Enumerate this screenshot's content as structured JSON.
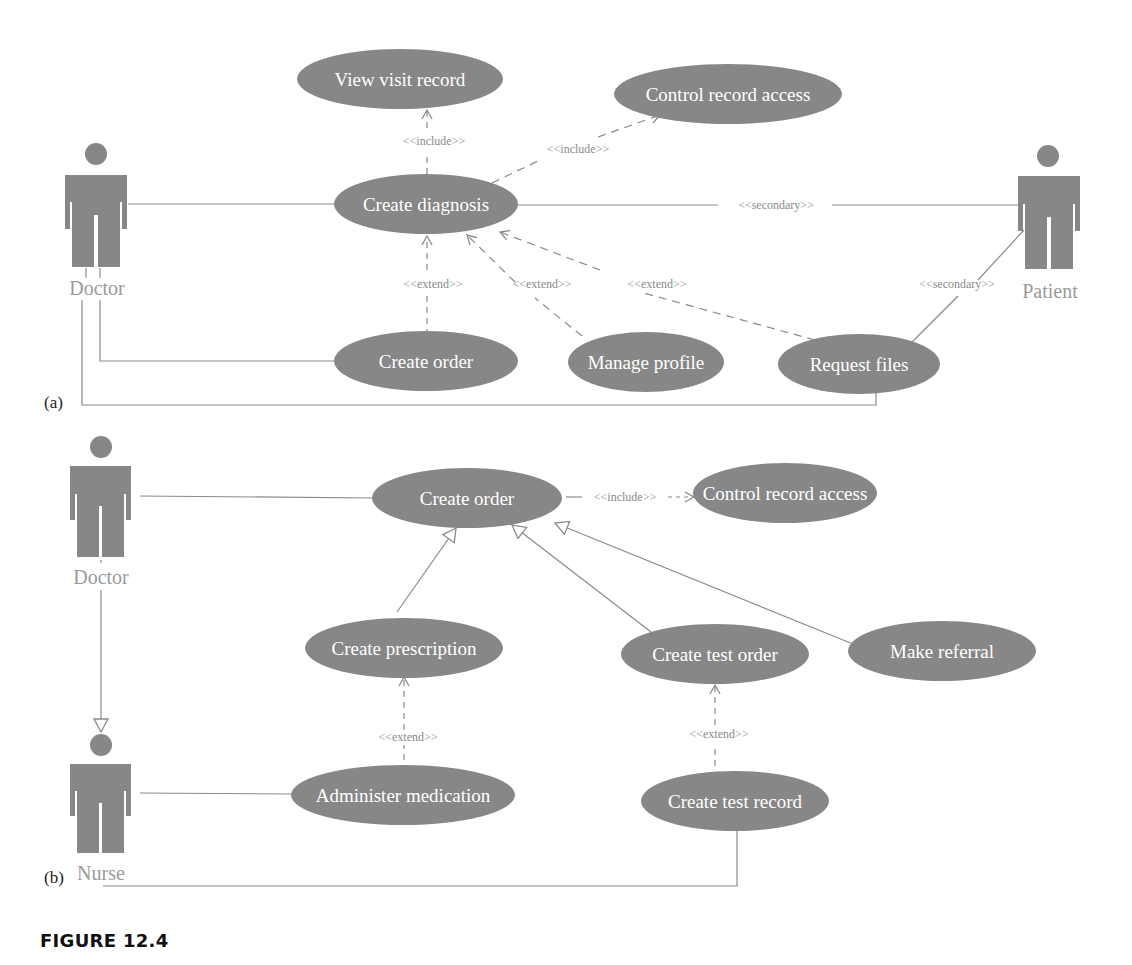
{
  "figure": {
    "caption": "FIGURE 12.4",
    "colors": {
      "usecase_fill": "#878787",
      "actor_fill": "#878787",
      "line": "#8a8a8a",
      "text_on_usecase": "#ffffff",
      "actor_label": "#9a9a9a"
    }
  },
  "panel_a": {
    "label": "(a)",
    "actors": {
      "doctor": "Doctor",
      "patient": "Patient"
    },
    "usecases": {
      "view_visit_record": "View visit record",
      "control_record_access": "Control record access",
      "create_diagnosis": "Create diagnosis",
      "create_order": "Create order",
      "manage_profile": "Manage profile",
      "request_files": "Request files"
    },
    "relations": {
      "include_view": "<<include>>",
      "include_control": "<<include>>",
      "secondary_diag": "<<secondary>>",
      "secondary_files": "<<secondary>>",
      "extend_order": "<<extend>>",
      "extend_profile": "<<extend>>",
      "extend_files": "<<extend>>"
    }
  },
  "panel_b": {
    "label": "(b)",
    "actors": {
      "doctor": "Doctor",
      "nurse": "Nurse"
    },
    "usecases": {
      "create_order": "Create order",
      "control_record_access": "Control record access",
      "create_prescription": "Create prescription",
      "create_test_order": "Create test order",
      "make_referral": "Make referral",
      "administer_medication": "Administer medication",
      "create_test_record": "Create test record"
    },
    "relations": {
      "include_control": "<<include>>",
      "extend_prescription": "<<extend>>",
      "extend_test_order": "<<extend>>"
    }
  }
}
